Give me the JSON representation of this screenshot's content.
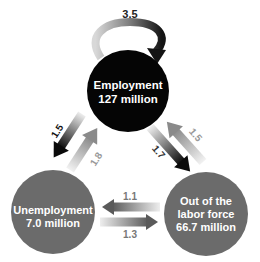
{
  "nodes": {
    "employment": {
      "title": "Employment",
      "value": "127 million",
      "color": "#050505"
    },
    "unemployment": {
      "title": "Unemployment",
      "value": "7.0 million",
      "color": "#6b6b6b"
    },
    "out_of_labor_force": {
      "title_line1": "Out of the",
      "title_line2": "labor force",
      "value": "66.7 million",
      "color": "#6b6b6b"
    }
  },
  "flows": {
    "employment_to_employment": {
      "label": "3.5",
      "label_color": "#222222"
    },
    "employment_to_unemployment": {
      "label": "1.5",
      "label_color": "#111111"
    },
    "unemployment_to_employment": {
      "label": "1.8",
      "label_color": "#999999"
    },
    "employment_to_out": {
      "label": "1.7",
      "label_color": "#333333"
    },
    "out_to_employment": {
      "label": "1.5",
      "label_color": "#999999"
    },
    "out_to_unemployment": {
      "label": "1.1",
      "label_color": "#777777"
    },
    "unemployment_to_out": {
      "label": "1.3",
      "label_color": "#777777"
    }
  }
}
